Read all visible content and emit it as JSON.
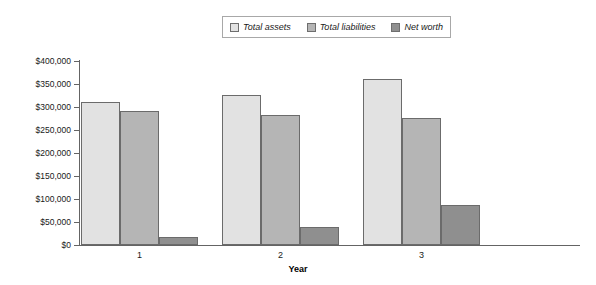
{
  "chart_data": {
    "type": "bar",
    "title": "",
    "xlabel": "Year",
    "ylabel": "",
    "categories": [
      "1",
      "2",
      "3"
    ],
    "series": [
      {
        "name": "Total assets",
        "values": [
          310000,
          326000,
          360000
        ],
        "color": "#e2e2e2"
      },
      {
        "name": "Total liabilities",
        "values": [
          292000,
          282000,
          277000
        ],
        "color": "#b5b5b5"
      },
      {
        "name": "Net worth",
        "values": [
          18000,
          40000,
          88000
        ],
        "color": "#8f8f8f"
      }
    ],
    "ylim": [
      0,
      400000
    ],
    "ytick_values": [
      0,
      50000,
      100000,
      150000,
      200000,
      250000,
      300000,
      350000,
      400000
    ],
    "ytick_labels": [
      "$0",
      "$50,000",
      "$100,000",
      "$150,000",
      "$200,000",
      "$250,000",
      "$300,000",
      "$350,000",
      "$400,000"
    ],
    "grid": false,
    "legend_position": "top-center",
    "bar_border_color": "#6b6b6b",
    "axis_color": "#646464"
  },
  "legend": {
    "entries": [
      {
        "label": "Total assets"
      },
      {
        "label": "Total liabilities"
      },
      {
        "label": "Net worth"
      }
    ]
  },
  "axes": {
    "x_title": "Year"
  }
}
